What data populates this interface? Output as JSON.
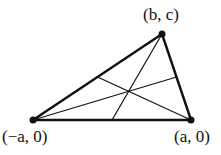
{
  "figure": {
    "type": "triangle-with-medians",
    "vertices": {
      "top": {
        "label": "(b, c)",
        "x": 162,
        "y": 34
      },
      "left": {
        "label": "(−a, 0)",
        "x": 33,
        "y": 120
      },
      "right": {
        "label": "(a, 0)",
        "x": 191,
        "y": 120
      }
    },
    "line_color": "#111111"
  }
}
